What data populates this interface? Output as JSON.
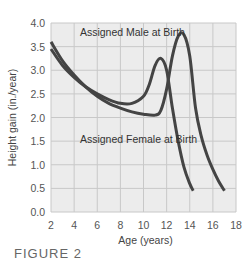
{
  "chart_data": {
    "type": "line",
    "title": "",
    "xlabel": "Age (years)",
    "ylabel": "Height gain (in./year)",
    "xlim": [
      2,
      18
    ],
    "ylim": [
      0,
      4.0
    ],
    "xticks": [
      2,
      4,
      6,
      8,
      10,
      12,
      14,
      16,
      18
    ],
    "yticks": [
      "0.0",
      "0.5",
      "1.0",
      "1.5",
      "2.0",
      "2.5",
      "3.0",
      "3.5",
      "4.0"
    ],
    "grid": true,
    "legend": "none (inline annotations)",
    "annotations": [
      {
        "text": "Assigned Male at Birth",
        "x": 4.5,
        "y": 3.8
      },
      {
        "text": "Assigned Female at Birth",
        "x": 4.5,
        "y": 1.55
      }
    ],
    "series": [
      {
        "name": "Assigned Female at Birth",
        "x": [
          2,
          3,
          4,
          5,
          6,
          7,
          8,
          9,
          10,
          10.5,
          11,
          11.5,
          12,
          12.5,
          13,
          13.5,
          14,
          14.3
        ],
        "y": [
          3.45,
          3.1,
          2.85,
          2.65,
          2.5,
          2.38,
          2.3,
          2.3,
          2.45,
          2.7,
          3.1,
          3.25,
          3.0,
          2.2,
          1.5,
          0.95,
          0.6,
          0.45
        ]
      },
      {
        "name": "Assigned Male at Birth",
        "x": [
          2,
          3,
          4,
          5,
          6,
          7,
          8,
          9,
          10,
          11,
          11.5,
          12,
          12.5,
          13,
          13.5,
          14,
          14.5,
          15,
          15.5,
          16,
          16.5,
          17
        ],
        "y": [
          3.6,
          3.2,
          2.9,
          2.65,
          2.45,
          2.3,
          2.2,
          2.12,
          2.07,
          2.05,
          2.15,
          2.6,
          3.3,
          3.72,
          3.75,
          3.3,
          2.2,
          1.6,
          1.2,
          0.9,
          0.65,
          0.45
        ]
      }
    ]
  },
  "caption": "FIGURE 2",
  "colors": {
    "plot_bg": "#ececec",
    "grid": "#c8c8c8",
    "line": "#444444"
  }
}
